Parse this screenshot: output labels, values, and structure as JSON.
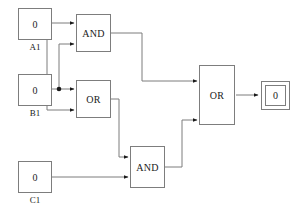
{
  "diagram": {
    "wire_color": "#7d7d7d",
    "text_color": "#1a1a1a",
    "background": "#ffffff"
  },
  "inputs": [
    {
      "id": "A1",
      "label": "A1",
      "value": "0"
    },
    {
      "id": "B1",
      "label": "B1",
      "value": "0"
    },
    {
      "id": "C1",
      "label": "C1",
      "value": "0"
    }
  ],
  "gates": [
    {
      "id": "and-top",
      "type": "AND",
      "label": "AND"
    },
    {
      "id": "or-mid",
      "type": "OR",
      "label": "OR"
    },
    {
      "id": "and-bottom",
      "type": "AND",
      "label": "AND"
    },
    {
      "id": "or-main",
      "type": "OR",
      "label": "OR"
    }
  ],
  "output": {
    "id": "out1",
    "value": "0"
  }
}
